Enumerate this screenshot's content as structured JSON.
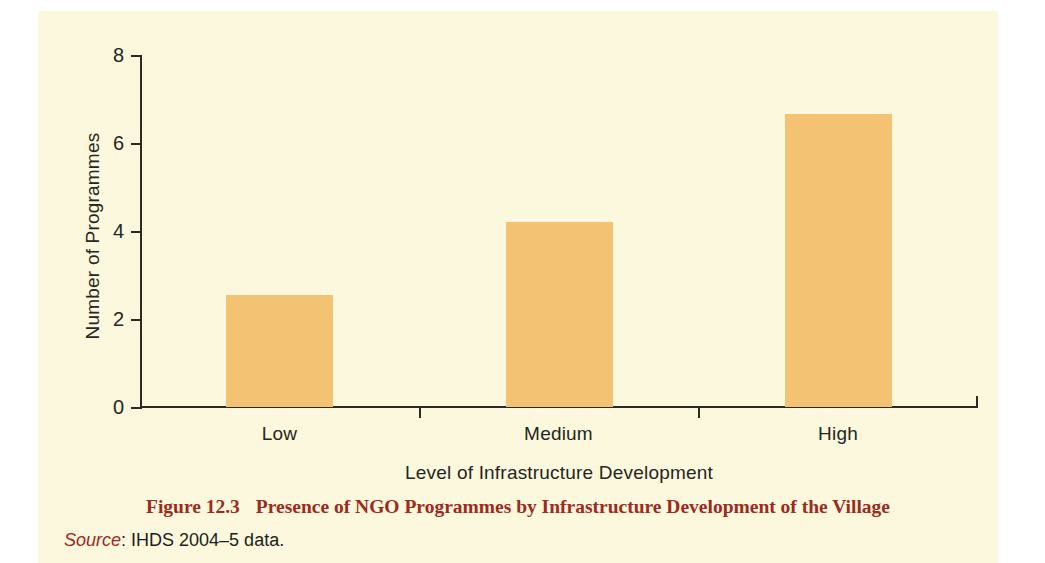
{
  "figure": {
    "caption_number": "Figure 12.3",
    "caption_title": "Presence of NGO Programmes by Infrastructure Development of the Village",
    "source_word": "Source",
    "source_text": ": IHDS 2004–5 data.",
    "caption_color": "#9d2a20"
  },
  "chart_data": {
    "type": "bar",
    "title": "Presence of NGO Programmes by Infrastructure Development of the Village",
    "categories": [
      "Low",
      "Medium",
      "High"
    ],
    "values": [
      2.55,
      4.2,
      6.65
    ],
    "xlabel": "Level of Infrastructure Development",
    "ylabel": "Number of Programmes",
    "ylim": [
      0,
      8
    ],
    "yticks": [
      0,
      2,
      4,
      6,
      8
    ],
    "ytick_labels": [
      "0",
      "2",
      "4",
      "6",
      "8"
    ],
    "grid": false,
    "legend": false,
    "bar_color": "#f3c273",
    "axis_color": "#2b2a24",
    "background": "#fbf8dd"
  }
}
